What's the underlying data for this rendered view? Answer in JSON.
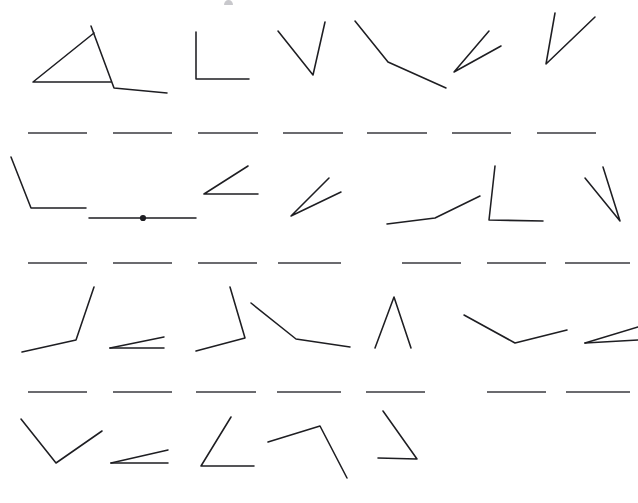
{
  "page": {
    "width": 638,
    "height": 503,
    "background_color": "#ffffff",
    "ink_color": "#1e1e22",
    "baseline_color": "#3a3a3f",
    "rows_of_figures": 4,
    "figures_per_row": 7,
    "baseline_rows": 3
  },
  "artifacts": {
    "top_edge_glyph": {
      "name": "clipped-character-top-edge",
      "x": 224,
      "y": 0,
      "width": 9,
      "height": 5,
      "color": "#c8c8cc"
    }
  },
  "figures": [
    {
      "id": "r1c1",
      "label": "angle-figure-row1-col1",
      "vertex": [
        33,
        82
      ],
      "points": "94,33 33,82 111,82",
      "has_vertex_dot": false
    },
    {
      "id": "r1c2",
      "label": "angle-figure-row1-col2",
      "vertex": [
        114,
        88
      ],
      "points": "91,26 114,88 167,93",
      "has_vertex_dot": false
    },
    {
      "id": "r1c3",
      "label": "angle-figure-row1-col3",
      "vertex": [
        196,
        79
      ],
      "points": "196,32 196,79 249,79",
      "has_vertex_dot": false
    },
    {
      "id": "r1c4",
      "label": "angle-figure-row1-col4",
      "vertex": [
        313,
        75
      ],
      "points": "278,31 313,75 325,22",
      "has_vertex_dot": false
    },
    {
      "id": "r1c5",
      "label": "angle-figure-row1-col5",
      "vertex": [
        388,
        62
      ],
      "points": "355,21 388,62 446,88",
      "has_vertex_dot": false
    },
    {
      "id": "r1c6",
      "label": "angle-figure-row1-col6",
      "vertex": [
        454,
        72
      ],
      "points": "489,31 454,72 501,46",
      "has_vertex_dot": false
    },
    {
      "id": "r1c7",
      "label": "angle-figure-row1-col7",
      "vertex": [
        546,
        64
      ],
      "points": "555,13 546,64 595,17",
      "has_vertex_dot": false
    },
    {
      "id": "r2c1",
      "label": "angle-figure-row2-col1",
      "vertex": [
        31,
        208
      ],
      "points": "11,157 31,208 86,208",
      "has_vertex_dot": false
    },
    {
      "id": "r2c2",
      "label": "angle-figure-row2-col2-straight",
      "vertex": [
        143,
        218
      ],
      "points": "89,218 143,218 196,218",
      "has_vertex_dot": true
    },
    {
      "id": "r2c3",
      "label": "angle-figure-row2-col3",
      "vertex": [
        204,
        194
      ],
      "points": "248,166 204,194 258,194",
      "has_vertex_dot": false
    },
    {
      "id": "r2c4",
      "label": "angle-figure-row2-col4",
      "vertex": [
        291,
        216
      ],
      "points": "329,178 291,216 341,192",
      "has_vertex_dot": false
    },
    {
      "id": "r2c5",
      "label": "angle-figure-row2-col5",
      "vertex": [
        435,
        218
      ],
      "points": "387, 224 435,218 480,196",
      "has_vertex_dot": false
    },
    {
      "id": "r2c6",
      "label": "angle-figure-row2-col6",
      "vertex": [
        489,
        220
      ],
      "points": "495,166 489,220 543,221",
      "has_vertex_dot": false
    },
    {
      "id": "r2c7",
      "label": "angle-figure-row2-col7",
      "vertex": [
        620,
        221
      ],
      "points": "585,178 620,221 603,167",
      "has_vertex_dot": false
    },
    {
      "id": "r3c1",
      "label": "angle-figure-row3-col1",
      "vertex": [
        76,
        340
      ],
      "points": "22,352 76,340 94,287",
      "has_vertex_dot": false
    },
    {
      "id": "r3c2",
      "label": "angle-figure-row3-col2",
      "vertex": [
        110,
        348
      ],
      "points": "110,348 164,337",
      "second_ray": "110,348 164,348",
      "has_vertex_dot": false
    },
    {
      "id": "r3c3",
      "label": "angle-figure-row3-col3",
      "vertex": [
        245,
        338
      ],
      "points": "230,287 245,338 196,351",
      "has_vertex_dot": false
    },
    {
      "id": "r3c4",
      "label": "angle-figure-row3-col4",
      "vertex": [
        296,
        339
      ],
      "points": "251,303 296,339 350,347",
      "has_vertex_dot": false
    },
    {
      "id": "r3c5",
      "label": "angle-figure-row3-col5",
      "vertex": [
        394,
        297
      ],
      "points": "375,348 394,297 411,348",
      "has_vertex_dot": false
    },
    {
      "id": "r3c6",
      "label": "angle-figure-row3-col6",
      "vertex": [
        515,
        343
      ],
      "points": "464,315 515,343 567,330",
      "has_vertex_dot": false
    },
    {
      "id": "r3c7",
      "label": "angle-figure-row3-col7",
      "vertex": [
        585,
        343
      ],
      "points": "585,343 638,327",
      "second_ray": "585,343 638,340",
      "has_vertex_dot": false
    },
    {
      "id": "r4c1",
      "label": "angle-figure-row4-col1",
      "vertex": [
        56,
        463
      ],
      "points": "21,419 56,463 102,431",
      "has_vertex_dot": false
    },
    {
      "id": "r4c2",
      "label": "angle-figure-row4-col2",
      "vertex": [
        111,
        463
      ],
      "points": "111,463 168,450",
      "second_ray": "111,463 168,463",
      "has_vertex_dot": false
    },
    {
      "id": "r4c3",
      "label": "angle-figure-row4-col3",
      "vertex": [
        201,
        466
      ],
      "points": "231,417 201,466 254,466",
      "has_vertex_dot": false
    },
    {
      "id": "r4c4",
      "label": "angle-figure-row4-col4",
      "vertex": [
        320,
        426
      ],
      "points": "268,442 320,426 347,478",
      "has_vertex_dot": false
    },
    {
      "id": "r4c5",
      "label": "angle-figure-row4-col5",
      "vertex": [
        417,
        459
      ],
      "points": "378,458 417,459 383,411",
      "has_vertex_dot": false
    }
  ],
  "baseline_rows": [
    {
      "id": "baselines-row-1",
      "label": "reference-baselines-row-1",
      "y": 133,
      "segments": [
        {
          "x1": 28,
          "x2": 87
        },
        {
          "x1": 113,
          "x2": 172
        },
        {
          "x1": 198,
          "x2": 258
        },
        {
          "x1": 283,
          "x2": 343
        },
        {
          "x1": 367,
          "x2": 427
        },
        {
          "x1": 452,
          "x2": 511
        },
        {
          "x1": 537,
          "x2": 596
        }
      ]
    },
    {
      "id": "baselines-row-2",
      "label": "reference-baselines-row-2",
      "y": 263,
      "segments": [
        {
          "x1": 28,
          "x2": 87
        },
        {
          "x1": 113,
          "x2": 172
        },
        {
          "x1": 198,
          "x2": 257
        },
        {
          "x1": 278,
          "x2": 341
        },
        {
          "x1": 402,
          "x2": 461
        },
        {
          "x1": 487,
          "x2": 546
        },
        {
          "x1": 565,
          "x2": 630
        }
      ]
    },
    {
      "id": "baselines-row-3",
      "label": "reference-baselines-row-3",
      "y": 392,
      "segments": [
        {
          "x1": 28,
          "x2": 87
        },
        {
          "x1": 113,
          "x2": 172
        },
        {
          "x1": 196,
          "x2": 256
        },
        {
          "x1": 277,
          "x2": 341
        },
        {
          "x1": 366,
          "x2": 425
        },
        {
          "x1": 487,
          "x2": 546
        },
        {
          "x1": 566,
          "x2": 630
        }
      ]
    }
  ]
}
